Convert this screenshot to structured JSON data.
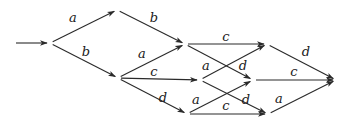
{
  "diagram": {
    "type": "state-transition-graph",
    "start_arrow": {
      "from": [
        16,
        43
      ],
      "to": [
        47,
        43
      ]
    },
    "nodes": [
      {
        "id": "n0",
        "x": 50,
        "y": 43
      },
      {
        "id": "n1",
        "x": 117,
        "y": 10
      },
      {
        "id": "n2",
        "x": 118,
        "y": 78
      },
      {
        "id": "n3",
        "x": 185,
        "y": 44
      },
      {
        "id": "n4",
        "x": 200,
        "y": 80
      },
      {
        "id": "n5",
        "x": 187,
        "y": 114
      },
      {
        "id": "n6",
        "x": 267,
        "y": 44
      },
      {
        "id": "n7",
        "x": 253,
        "y": 80
      },
      {
        "id": "n8",
        "x": 268,
        "y": 114
      },
      {
        "id": "n9",
        "x": 336,
        "y": 80
      }
    ],
    "edges": [
      {
        "from": "n0",
        "to": "n1",
        "label": "a",
        "lx": 73,
        "ly": 22
      },
      {
        "from": "n0",
        "to": "n2",
        "label": "b",
        "lx": 86,
        "ly": 56
      },
      {
        "from": "n1",
        "to": "n3",
        "label": "b",
        "lx": 154,
        "ly": 22
      },
      {
        "from": "n2",
        "to": "n3",
        "label": "a",
        "lx": 142,
        "ly": 58
      },
      {
        "from": "n2",
        "to": "n4",
        "label": "c",
        "lx": 154,
        "ly": 76
      },
      {
        "from": "n2",
        "to": "n5",
        "label": "d",
        "lx": 163,
        "ly": 102
      },
      {
        "from": "n3",
        "to": "n6",
        "label": "c",
        "lx": 226,
        "ly": 41
      },
      {
        "from": "n3",
        "to": "n7",
        "label": "d",
        "lx": 243,
        "ly": 70
      },
      {
        "from": "n4",
        "to": "n6",
        "label": "a",
        "lx": 206,
        "ly": 70
      },
      {
        "from": "n4",
        "to": "n8",
        "label": "d",
        "lx": 246,
        "ly": 104
      },
      {
        "from": "n5",
        "to": "n7",
        "label": "a",
        "lx": 196,
        "ly": 104
      },
      {
        "from": "n5",
        "to": "n8",
        "label": "c",
        "lx": 226,
        "ly": 110
      },
      {
        "from": "n6",
        "to": "n9",
        "label": "d",
        "lx": 306,
        "ly": 56
      },
      {
        "from": "n7",
        "to": "n9",
        "label": "c",
        "lx": 294,
        "ly": 76
      },
      {
        "from": "n8",
        "to": "n9",
        "label": "a",
        "lx": 279,
        "ly": 103
      }
    ]
  },
  "colors": {
    "line": "#2a2a2a",
    "text": "#1a1a1a",
    "background": "#ffffff"
  }
}
